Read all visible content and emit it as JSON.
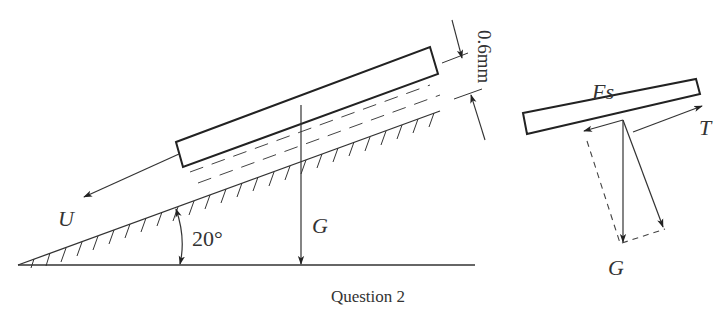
{
  "figure": {
    "caption": "Question 2",
    "colors": {
      "stroke": "#222222",
      "text": "#333333",
      "background": "#ffffff"
    }
  },
  "left_diagram": {
    "labels": {
      "velocity": "U",
      "weight": "G",
      "angle": "20°",
      "gap": "0.6mm"
    },
    "elements": [
      "plate",
      "oil-film",
      "inclined-surface",
      "ground-line",
      "angle-arc",
      "weight-arrow",
      "velocity-arrow",
      "gap-dimension"
    ]
  },
  "right_diagram": {
    "labels": {
      "shear_force": "Fs",
      "tension": "T",
      "weight": "G"
    },
    "elements": [
      "plate",
      "shear-force-arrow",
      "tension-arrow",
      "weight-arrow",
      "normal-component-arrow",
      "parallelogram-dashed-lines"
    ]
  }
}
